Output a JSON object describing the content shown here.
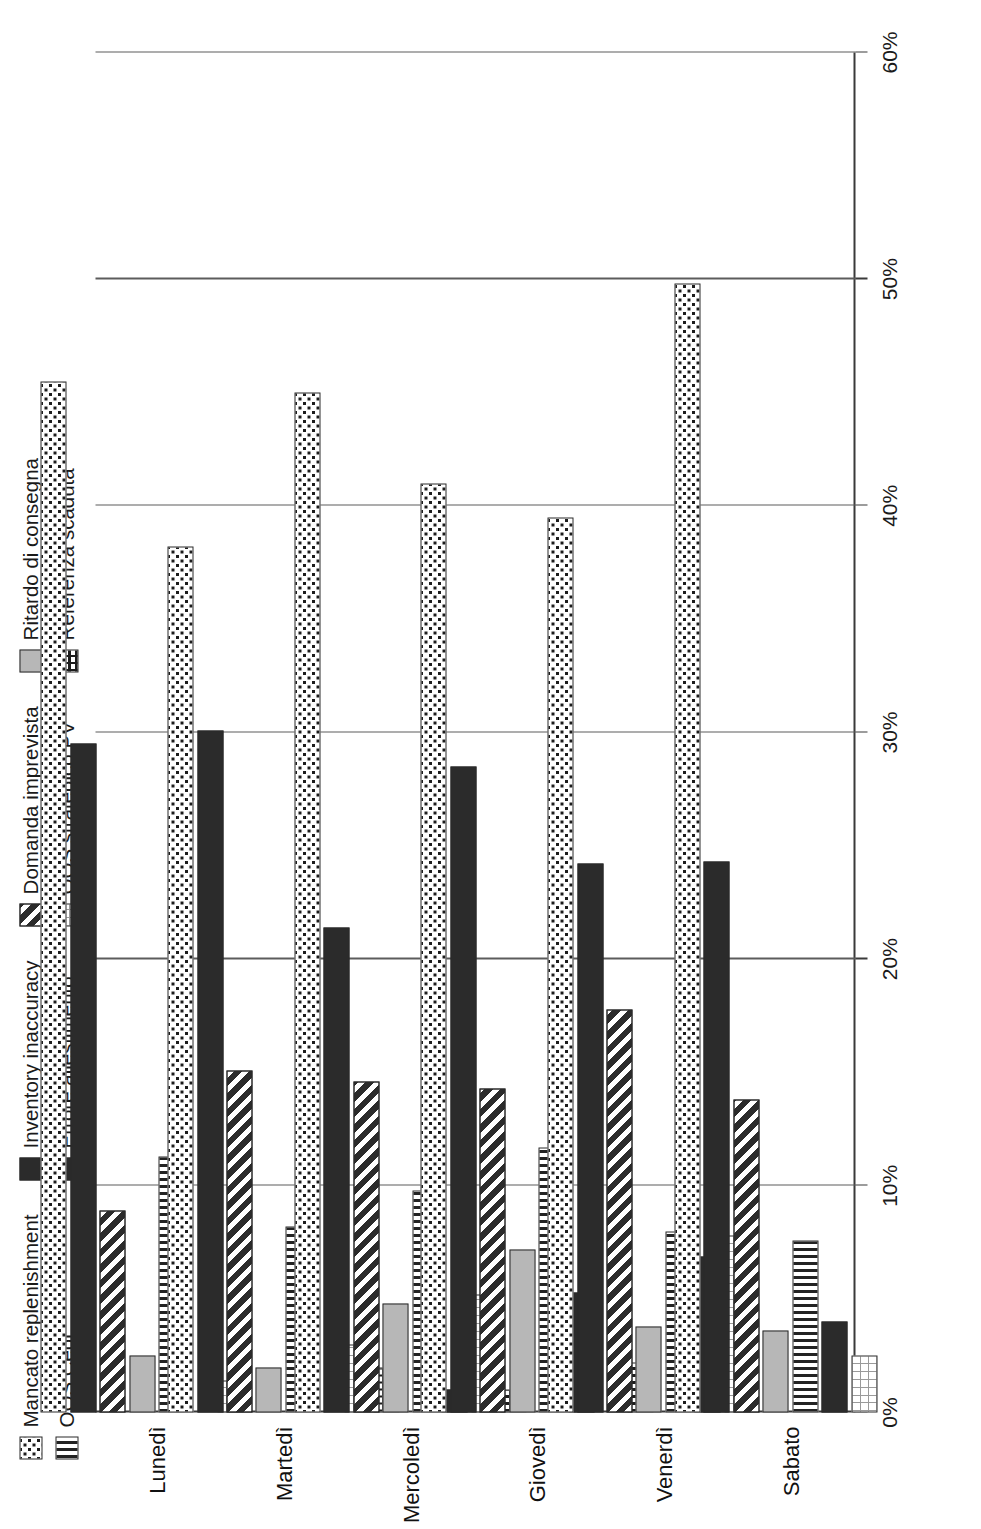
{
  "chart_data": {
    "type": "bar",
    "orientation": "horizontal-stacked",
    "title": "",
    "subtitle": "",
    "xlabel": "",
    "ylabel": "",
    "xlim": [
      0,
      60
    ],
    "grid": true,
    "legend_position": "top-left",
    "axis_tick_labels": [
      "0%",
      "10%",
      "20%",
      "30%",
      "40%",
      "50%",
      "60%"
    ],
    "axis_tick_values": [
      0,
      10,
      20,
      30,
      40,
      50,
      60
    ],
    "categories": [
      "Lunedì",
      "Martedì",
      "Mercoledì",
      "Giovedì",
      "Venerdì",
      "Sabato"
    ],
    "series": [
      {
        "name": "Mancato replenishment",
        "pattern": "dots",
        "values": [
          45.5,
          38.2,
          45.0,
          41.0,
          39.5,
          49.8
        ]
      },
      {
        "name": "Inventory inaccuracy",
        "pattern": "solid",
        "values": [
          29.5,
          30.1,
          21.4,
          28.5,
          24.2,
          24.3
        ]
      },
      {
        "name": "Domanda imprevista",
        "pattern": "diagonal",
        "values": [
          8.9,
          15.1,
          14.6,
          14.3,
          17.8,
          13.8
        ]
      },
      {
        "name": "Ritardo di consegna",
        "pattern": "gray",
        "values": [
          2.5,
          2.0,
          4.8,
          7.2,
          3.8,
          3.6
        ]
      },
      {
        "name": "OOS Cedi",
        "pattern": "vertical",
        "values": [
          11.3,
          8.2,
          9.8,
          11.7,
          8.0,
          7.6
        ]
      },
      {
        "name": "Errore allestimento",
        "pattern": "solid",
        "values": [
          0.0,
          0.0,
          1.0,
          5.3,
          6.9,
          4.0
        ]
      },
      {
        "name": "OOS strategico PV",
        "pattern": "grid-light",
        "values": [
          1.4,
          3.0,
          5.2,
          0.0,
          7.8,
          2.5
        ]
      },
      {
        "name": "Referenza scaduta",
        "pattern": "grid-dark",
        "values": [
          0.0,
          2.0,
          1.0,
          2.2,
          0.0,
          0.0
        ]
      }
    ]
  },
  "legend": {
    "items": [
      {
        "label": "Mancato replenishment",
        "pattern": "dots"
      },
      {
        "label": "OOS Cedi",
        "pattern": "vertical"
      },
      {
        "label": "Inventory inaccuracy",
        "pattern": "solid"
      },
      {
        "label": "Errore allestimento",
        "pattern": "solid"
      },
      {
        "label": "Domanda imprevista",
        "pattern": "diagonal"
      },
      {
        "label": "OOS strategico PV",
        "pattern": "grid-light"
      },
      {
        "label": "Ritardo di consegna",
        "pattern": "gray"
      },
      {
        "label": "Referenza scaduta",
        "pattern": "grid-dark"
      }
    ]
  },
  "colors": {
    "dark": "#2b2b2b",
    "gray": "#b7b7b7",
    "white": "#ffffff",
    "axis": "#3a3a3a",
    "grid": "#5c5c5c"
  }
}
